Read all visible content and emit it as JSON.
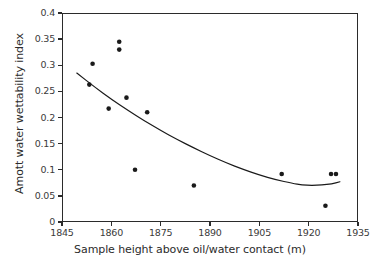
{
  "chart_data": {
    "type": "scatter",
    "title": "",
    "xlabel": "Sample height above oil/water contact (m)",
    "ylabel": "Amott water wettability index",
    "xlim": [
      1845,
      1935
    ],
    "ylim": [
      0,
      0.4
    ],
    "xticks": [
      "1845",
      "1860",
      "1875",
      "1890",
      "1905",
      "1920",
      "1935"
    ],
    "xtick_values": [
      1845,
      1860,
      1875,
      1890,
      1905,
      1920,
      1935
    ],
    "yticks": [
      "0",
      "0.05",
      "0.1",
      "0.15",
      "0.2",
      "0.25",
      "0.3",
      "0.35",
      "0.4"
    ],
    "ytick_values": [
      0,
      0.05,
      0.1,
      0.15,
      0.2,
      0.25,
      0.3,
      0.35,
      0.4
    ],
    "grid": false,
    "legend": false,
    "marker": "filled-circle",
    "marker_color": "#1a1a1a",
    "line_color": "#1a1a1a",
    "points": [
      {
        "x": 1853.3,
        "y": 0.263
      },
      {
        "x": 1854.3,
        "y": 0.303
      },
      {
        "x": 1859.2,
        "y": 0.217
      },
      {
        "x": 1862.4,
        "y": 0.345
      },
      {
        "x": 1862.4,
        "y": 0.33
      },
      {
        "x": 1864.6,
        "y": 0.238
      },
      {
        "x": 1867.2,
        "y": 0.1
      },
      {
        "x": 1870.9,
        "y": 0.21
      },
      {
        "x": 1885.1,
        "y": 0.07
      },
      {
        "x": 1911.8,
        "y": 0.092
      },
      {
        "x": 1925.1,
        "y": 0.031
      },
      {
        "x": 1926.8,
        "y": 0.092
      },
      {
        "x": 1928.3,
        "y": 0.092
      }
    ],
    "trend_curve": {
      "description": "fitted quadratic trend line",
      "x_start": 1849.5,
      "x_end": 1929.5,
      "points": [
        {
          "x": 1849.5,
          "y": 0.285
        },
        {
          "x": 1855.0,
          "y": 0.258
        },
        {
          "x": 1860.0,
          "y": 0.235
        },
        {
          "x": 1865.0,
          "y": 0.214
        },
        {
          "x": 1870.0,
          "y": 0.194
        },
        {
          "x": 1875.0,
          "y": 0.175
        },
        {
          "x": 1880.0,
          "y": 0.158
        },
        {
          "x": 1885.0,
          "y": 0.142
        },
        {
          "x": 1890.0,
          "y": 0.127
        },
        {
          "x": 1895.0,
          "y": 0.113
        },
        {
          "x": 1900.0,
          "y": 0.101
        },
        {
          "x": 1905.0,
          "y": 0.09
        },
        {
          "x": 1910.0,
          "y": 0.081
        },
        {
          "x": 1915.0,
          "y": 0.074
        },
        {
          "x": 1918.0,
          "y": 0.071
        },
        {
          "x": 1921.0,
          "y": 0.07
        },
        {
          "x": 1924.0,
          "y": 0.071
        },
        {
          "x": 1927.0,
          "y": 0.073
        },
        {
          "x": 1929.5,
          "y": 0.077
        }
      ]
    }
  }
}
